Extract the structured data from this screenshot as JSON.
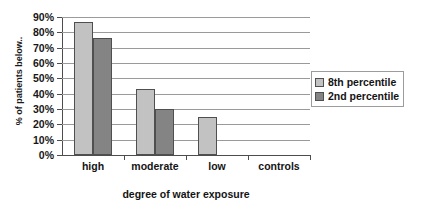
{
  "chart_data": {
    "type": "bar",
    "title": "",
    "categories": [
      "high",
      "moderate",
      "low",
      "controls"
    ],
    "series": [
      {
        "name": "8th percentile",
        "color": "#c2c2c2",
        "values": [
          87,
          43,
          25,
          0
        ]
      },
      {
        "name": "2nd percentile",
        "color": "#848484",
        "values": [
          76,
          30,
          0,
          0
        ]
      }
    ],
    "xlabel": "degree of water exposure",
    "ylabel": "% of patients below..",
    "ylim": [
      0,
      90
    ],
    "ytick_step": 10,
    "ytick_labels": [
      "0%",
      "10%",
      "20%",
      "30%",
      "40%",
      "50%",
      "60%",
      "70%",
      "80%",
      "90%"
    ],
    "grid": true,
    "legend_position": "right"
  }
}
